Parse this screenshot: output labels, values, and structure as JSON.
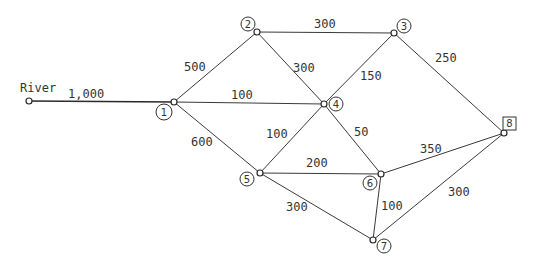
{
  "diagram": {
    "type": "network",
    "source_label": "River",
    "nodes": [
      {
        "id": "river",
        "label": "River"
      },
      {
        "id": "1",
        "label": "1"
      },
      {
        "id": "2",
        "label": "2"
      },
      {
        "id": "3",
        "label": "3"
      },
      {
        "id": "4",
        "label": "4"
      },
      {
        "id": "5",
        "label": "5"
      },
      {
        "id": "6",
        "label": "6"
      },
      {
        "id": "7",
        "label": "7"
      },
      {
        "id": "8",
        "label": "8",
        "shape": "square"
      }
    ],
    "edges": [
      {
        "from": "river",
        "to": "1",
        "label": "1,000"
      },
      {
        "from": "1",
        "to": "2",
        "label": "500"
      },
      {
        "from": "1",
        "to": "4",
        "label": "100"
      },
      {
        "from": "1",
        "to": "5",
        "label": "600"
      },
      {
        "from": "2",
        "to": "3",
        "label": "300"
      },
      {
        "from": "2",
        "to": "4",
        "label": "300"
      },
      {
        "from": "3",
        "to": "4",
        "label": "150"
      },
      {
        "from": "3",
        "to": "8",
        "label": "250"
      },
      {
        "from": "4",
        "to": "5",
        "label": "100"
      },
      {
        "from": "4",
        "to": "6",
        "label": "50"
      },
      {
        "from": "5",
        "to": "6",
        "label": "200"
      },
      {
        "from": "5",
        "to": "7",
        "label": "300"
      },
      {
        "from": "6",
        "to": "7",
        "label": "100"
      },
      {
        "from": "6",
        "to": "8",
        "label": "350"
      },
      {
        "from": "7",
        "to": "8",
        "label": "300"
      }
    ]
  }
}
